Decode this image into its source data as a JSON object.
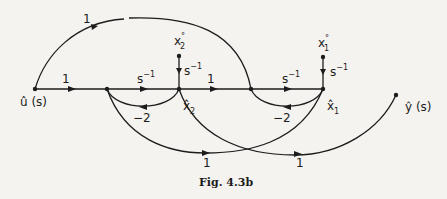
{
  "diagram": {
    "type": "signal-flow-graph",
    "caption": "Fig. 4.3b",
    "nodes": {
      "input": {
        "label": "û (s)"
      },
      "x2_hat": {
        "label": "x̂",
        "subscript": "2"
      },
      "x1_hat": {
        "label": "x̂",
        "subscript": "1"
      },
      "x2_init": {
        "label": "x",
        "superscript": "°",
        "subscript": "2"
      },
      "x1_init": {
        "label": "x",
        "superscript": "°",
        "subscript": "1"
      },
      "output": {
        "label": "ŷ (s)"
      }
    },
    "edges": {
      "top_arc_gain": "1",
      "input_gain": "1",
      "integrator1_base": "s",
      "integrator1_exp": "−1",
      "x2_init_gain_base": "s",
      "x2_init_gain_exp": "−1",
      "mid_gain": "1",
      "integrator2_base": "s",
      "integrator2_exp": "−1",
      "x1_init_gain_base": "s",
      "x1_init_gain_exp": "−1",
      "feedback1_gain": "−2",
      "feedback2_gain": "−2",
      "lower_arc1_gain": "1",
      "lower_arc2_gain": "1"
    }
  }
}
